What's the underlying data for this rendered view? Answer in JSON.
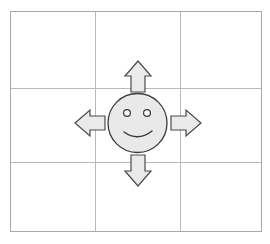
{
  "scene": {
    "title": "smiley-face-move-directions",
    "width": 270,
    "height": 244,
    "background_color": "#ffffff"
  },
  "grid": {
    "name": "three-by-three-grid",
    "columns": 3,
    "rows": 3,
    "bounds": {
      "x": 10,
      "y": 11,
      "width": 252,
      "height": 221
    },
    "vertical_lines_x": [
      95,
      180
    ],
    "horizontal_lines_y": [
      88,
      162
    ],
    "line_color": "#b9b9bb",
    "border_color": "#a8a8aa",
    "cells": [
      {
        "id": "cell-top-left",
        "row": 0,
        "col": 0,
        "occupied": false
      },
      {
        "id": "cell-top-center",
        "row": 0,
        "col": 1,
        "occupied": false
      },
      {
        "id": "cell-top-right",
        "row": 0,
        "col": 2,
        "occupied": false
      },
      {
        "id": "cell-middle-left",
        "row": 1,
        "col": 0,
        "occupied": false
      },
      {
        "id": "cell-middle-center",
        "row": 1,
        "col": 1,
        "occupied": true
      },
      {
        "id": "cell-middle-right",
        "row": 1,
        "col": 2,
        "occupied": false
      },
      {
        "id": "cell-bottom-left",
        "row": 2,
        "col": 0,
        "occupied": false
      },
      {
        "id": "cell-bottom-center",
        "row": 2,
        "col": 1,
        "occupied": false
      },
      {
        "id": "cell-bottom-right",
        "row": 2,
        "col": 2,
        "occupied": false
      }
    ]
  },
  "face": {
    "name": "smiley-face",
    "center_x": 137.5,
    "center_y": 123,
    "radius": 29.5,
    "fill_color": "#e9e9e9",
    "stroke_color": "#3a3a3a",
    "expression": "smiling",
    "eyes": [
      {
        "id": "eye-left",
        "cx": 127,
        "cy": 113,
        "r": 3.4
      },
      {
        "id": "eye-right",
        "cx": 147,
        "cy": 113,
        "r": 3.4
      },
      {
        "id": "mouth",
        "type": "smile-arc",
        "start_x": 124,
        "start_y": 132,
        "end_x": 152,
        "end_y": 132,
        "depth": 10
      }
    ]
  },
  "arrows": [
    {
      "id": "arrow-up",
      "direction": "up",
      "label": "Move up",
      "fill_color": "#eaeaea",
      "stroke_color": "#4a4a4a",
      "points": "138,61 151,76 145,76 145,92 131,92 131,76 125,76"
    },
    {
      "id": "arrow-down",
      "direction": "down",
      "label": "Move down",
      "fill_color": "#eaeaea",
      "stroke_color": "#4a4a4a",
      "points": "138,186 125,171 131,171 131,155 145,155 145,171 151,171"
    },
    {
      "id": "arrow-left",
      "direction": "left",
      "label": "Move left",
      "fill_color": "#eaeaea",
      "stroke_color": "#4a4a4a",
      "points": "75,123 90,110 90,116 105,116 105,130 90,130 90,136"
    },
    {
      "id": "arrow-right",
      "direction": "right",
      "label": "Move right",
      "fill_color": "#eaeaea",
      "stroke_color": "#4a4a4a",
      "points": "201,123 186,136 186,130 171,130 171,116 186,116 186,110"
    }
  ]
}
